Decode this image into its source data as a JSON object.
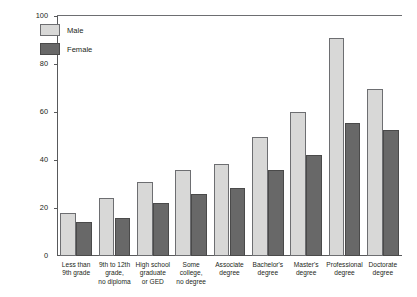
{
  "chart_data": {
    "type": "bar",
    "title": "",
    "xlabel": "",
    "ylabel": "",
    "ylim": [
      0,
      100
    ],
    "yticks": [
      0,
      20,
      40,
      60,
      80,
      100
    ],
    "grid": false,
    "legend_position": "top-left",
    "categories": [
      "Less than\n9th grade",
      "9th to 12th\ngrade,\nno diploma",
      "High school\ngraduate\nor GED",
      "Some\ncollege,\nno degree",
      "Associate\ndegree",
      "Bachelor's\ndegree",
      "Master's\ndegree",
      "Professional\ndegree",
      "Doctorate\ndegree"
    ],
    "category_lines": [
      [
        "Less than",
        "9th grade"
      ],
      [
        "9th to 12th",
        "grade,",
        "no diploma"
      ],
      [
        "High school",
        "graduate",
        "or GED"
      ],
      [
        "Some",
        "college,",
        "no degree"
      ],
      [
        "Associate",
        "degree"
      ],
      [
        "Bachelor's",
        "degree"
      ],
      [
        "Master's",
        "degree"
      ],
      [
        "Professional",
        "degree"
      ],
      [
        "Doctorate",
        "degree"
      ]
    ],
    "series": [
      {
        "name": "Male",
        "color": "#d8d8d7",
        "values": [
          18,
          24,
          31,
          36,
          38.5,
          49.5,
          60,
          91,
          69.5
        ]
      },
      {
        "name": "Female",
        "color": "#686868",
        "values": [
          14,
          16,
          22,
          26,
          28.5,
          36,
          42,
          55.5,
          52.5
        ]
      }
    ]
  },
  "legend": {
    "items": [
      {
        "label": "Male",
        "color": "#d8d8d7"
      },
      {
        "label": "Female",
        "color": "#686868"
      }
    ]
  },
  "axis": {
    "y_tick_labels": [
      "100",
      "80",
      "60",
      "40",
      "20",
      "0"
    ]
  }
}
